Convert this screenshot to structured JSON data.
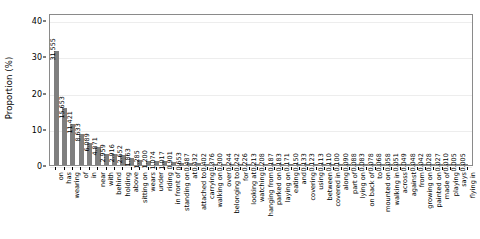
{
  "chart_data": {
    "type": "bar",
    "title": "",
    "xlabel": "",
    "ylabel": "Proportion (%)",
    "ylim": [
      0,
      42
    ],
    "yticks": [
      0,
      10,
      20,
      30,
      40
    ],
    "ytick_labels": [
      "0",
      "10",
      "20",
      "30",
      "40"
    ],
    "grid": true,
    "legend": "none",
    "bar_color": "#7f7f7f",
    "value_label_precision": 3,
    "categories": [
      "on",
      "has",
      "wearing",
      "of",
      "in",
      "near",
      "with",
      "behind",
      "holding",
      "above",
      "sitting on",
      "wears",
      "under",
      "riding",
      "in front of",
      "standing on",
      "at",
      "attached to",
      "carrying",
      "walking on",
      "over",
      "belonging to",
      "for",
      "looking at",
      "watching",
      "hanging from",
      "parked on",
      "laying on",
      "eating",
      "and",
      "covering",
      "using",
      "between",
      "covered in",
      "along",
      "part of",
      "lying on",
      "on back of",
      "to",
      "mounted on",
      "walking in",
      "across",
      "against",
      "from",
      "growing on",
      "painted on",
      "made of",
      "playing",
      "says",
      "flying in"
    ],
    "values": [
      31.555,
      15.653,
      11.421,
      8.633,
      6.089,
      4.871,
      2.959,
      2.916,
      2.652,
      1.863,
      1.285,
      1.2,
      1.074,
      1.017,
      0.901,
      0.653,
      0.487,
      0.432,
      0.402,
      0.376,
      0.3,
      0.244,
      0.242,
      0.226,
      0.213,
      0.208,
      0.187,
      0.183,
      0.171,
      0.15,
      0.133,
      0.123,
      0.113,
      0.11,
      0.1,
      0.09,
      0.088,
      0.083,
      0.078,
      0.068,
      0.058,
      0.051,
      0.049,
      0.048,
      0.042,
      0.028,
      0.027,
      0.01,
      0.005,
      0.005
    ],
    "value_labels": [
      "31.555",
      "15.653",
      "11.421",
      "8.633",
      "6.089",
      "4.871",
      "2.959",
      "2.916",
      "2.652",
      "1.863",
      "1.285",
      "1.200",
      "1.074",
      "1.017",
      "0.901",
      "0.653",
      "0.487",
      "0.432",
      "0.402",
      "0.376",
      "0.300",
      "0.244",
      "0.242",
      "0.226",
      "0.213",
      "0.208",
      "0.187",
      "0.183",
      "0.171",
      "0.150",
      "0.133",
      "0.123",
      "0.113",
      "0.110",
      "0.100",
      "0.090",
      "0.088",
      "0.083",
      "0.078",
      "0.068",
      "0.058",
      "0.051",
      "0.049",
      "0.048",
      "0.042",
      "0.028",
      "0.027",
      "0.010",
      "0.005",
      "0.005"
    ]
  }
}
